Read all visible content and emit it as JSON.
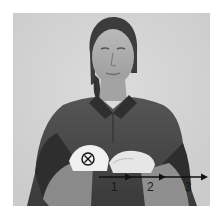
{
  "image": {
    "description": "Grayscale photo of a woman in a dark polo shirt demonstrating a sign with both hands held palms-down in front of her torso",
    "colors": {
      "background": "#d6d6d6",
      "shirt": "#4a4a4a",
      "shirt_dark": "#2e2e2e",
      "skin": "#a8a8a8",
      "hand_highlight": "#f2f2f2",
      "hair": "#3a3a3a",
      "annotation": "#111111"
    }
  },
  "annotations": {
    "start_marker": {
      "symbol": "⊗",
      "name": "circle-x",
      "cx": 75,
      "cy": 146,
      "r": 6
    },
    "movement_arrow": {
      "y": 164,
      "x_start": 86,
      "arrowheads_x": [
        119,
        153,
        194
      ]
    },
    "step_labels": [
      {
        "text": "1",
        "x": 98,
        "y": 168
      },
      {
        "text": "2",
        "x": 134,
        "y": 168
      },
      {
        "text": "3",
        "x": 172,
        "y": 168
      }
    ]
  }
}
